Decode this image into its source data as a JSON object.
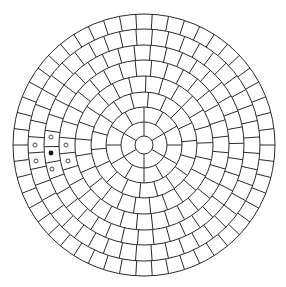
{
  "figure": {
    "title": "",
    "width": 286,
    "height": 287,
    "background": "#ffffff",
    "line_color": "#2a2a2a",
    "line_width": 1,
    "center": [
      144,
      145
    ],
    "central_disk_radius": 9,
    "rings": [
      {
        "r_inner": 9,
        "r_outer": 23,
        "segments": 6,
        "offset_deg": 90
      },
      {
        "r_inner": 23,
        "r_outer": 38,
        "segments": 12,
        "offset_deg": 0
      },
      {
        "r_inner": 38,
        "r_outer": 53,
        "segments": 18,
        "offset_deg": 5
      },
      {
        "r_inner": 53,
        "r_outer": 69,
        "segments": 25,
        "offset_deg": 2
      },
      {
        "r_inner": 69,
        "r_outer": 85,
        "segments": 32,
        "offset_deg": 6
      },
      {
        "r_inner": 85,
        "r_outer": 100,
        "segments": 38,
        "offset_deg": 1
      },
      {
        "r_inner": 100,
        "r_outer": 116,
        "segments": 44,
        "offset_deg": 4
      },
      {
        "r_inner": 116,
        "r_outer": 131,
        "segments": 50,
        "offset_deg": 0
      }
    ],
    "markers": {
      "center_cell": {
        "x": 51,
        "y": 153,
        "type": "filled",
        "r": 2.4
      },
      "neighbors": [
        {
          "x": 51,
          "y": 137,
          "type": "open",
          "r": 2
        },
        {
          "x": 35,
          "y": 145,
          "type": "open",
          "r": 2
        },
        {
          "x": 66,
          "y": 145,
          "type": "open",
          "r": 2
        },
        {
          "x": 36,
          "y": 161,
          "type": "open",
          "r": 2
        },
        {
          "x": 68,
          "y": 161,
          "type": "open",
          "r": 2
        },
        {
          "x": 52,
          "y": 169,
          "type": "open",
          "r": 2
        }
      ]
    }
  }
}
